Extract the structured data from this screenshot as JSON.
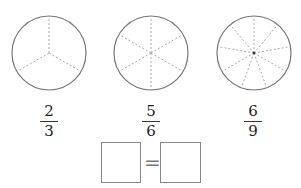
{
  "circles": [
    {
      "sectors": 3,
      "cx": 49,
      "cy": 53,
      "r": 37
    },
    {
      "sectors": 6,
      "cx": 151,
      "cy": 53,
      "r": 37
    },
    {
      "sectors": 9,
      "cx": 254,
      "cy": 53,
      "r": 37
    }
  ],
  "fractions": [
    {
      "numerator": "2",
      "denominator": "3"
    },
    {
      "numerator": "5",
      "denominator": "6"
    },
    {
      "numerator": "6",
      "denominator": "9"
    }
  ],
  "equation": {
    "left_box": "",
    "operator": "=",
    "right_box": ""
  },
  "colors": {
    "circle_stroke": "#777777",
    "divider_stroke": "#aaaaaa"
  }
}
